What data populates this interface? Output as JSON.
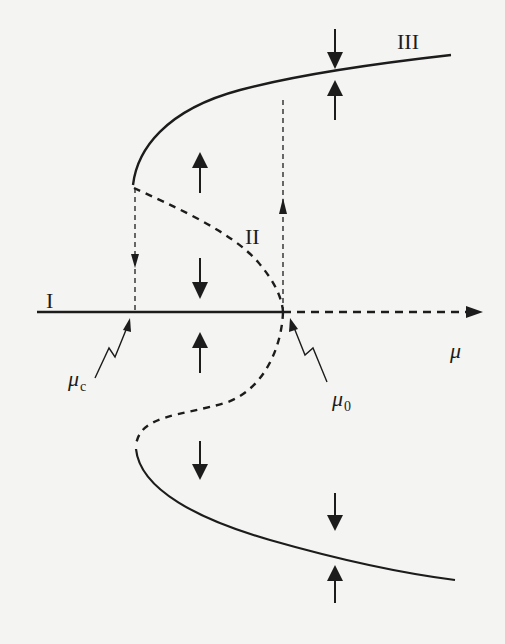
{
  "figure": {
    "type": "bifurcation-diagram",
    "colors": {
      "ink": "#1c1c1c",
      "paper": "#f4f4f2"
    },
    "axis": {
      "label": "μ",
      "style": "solid-then-dashed",
      "arrowhead": true
    },
    "branch_labels": {
      "I": "I",
      "II": "II",
      "III": "III"
    },
    "points": {
      "mu_c": {
        "symbol": "μ",
        "subscript": "c"
      },
      "mu_0": {
        "symbol": "μ",
        "subscript": "0"
      }
    },
    "branches": [
      {
        "name": "branch-I-stable-trivial",
        "style": "solid",
        "from": "left",
        "to": "mu_0"
      },
      {
        "name": "branch-trivial-unstable",
        "style": "dashed",
        "from": "mu_0",
        "to": "right"
      },
      {
        "name": "branch-III-upper-stable",
        "style": "solid"
      },
      {
        "name": "branch-upper-unstable",
        "style": "dashed"
      },
      {
        "name": "branch-lower-unstable",
        "style": "dashed"
      },
      {
        "name": "branch-lower-stable",
        "style": "solid"
      }
    ],
    "hysteresis": {
      "jump_down_at": "mu_c",
      "jump_up_at": "mu_0",
      "jump_label": "II"
    },
    "flow_arrows": [
      {
        "x": "mid",
        "direction": "up",
        "region": "between axis and upper-unstable (above)"
      },
      {
        "x": "mid",
        "direction": "down",
        "region": "between upper-unstable and axis"
      },
      {
        "x": "mid",
        "direction": "up",
        "region": "between axis and lower-unstable"
      },
      {
        "x": "mid",
        "direction": "down",
        "region": "below lower-unstable"
      },
      {
        "x": "right",
        "direction": "down",
        "region": "above upper-stable"
      },
      {
        "x": "right",
        "direction": "up",
        "region": "below upper-stable"
      },
      {
        "x": "right",
        "direction": "down",
        "region": "above lower-stable"
      },
      {
        "x": "right",
        "direction": "up",
        "region": "below lower-stable"
      }
    ]
  }
}
